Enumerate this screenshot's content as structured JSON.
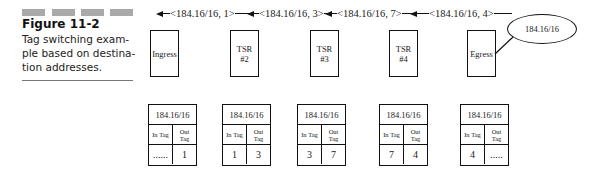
{
  "figure": {
    "number": "Figure 11-2",
    "caption_lines": [
      "Tag switching exam-",
      "ple based on destina-",
      "tion addresses."
    ]
  },
  "advertisements": [
    {
      "label": "<184.16/16, 1>"
    },
    {
      "label": "<184.16/16, 3>"
    },
    {
      "label": "<184.16/16, 7>"
    },
    {
      "label": "<184.16/16, 4>"
    }
  ],
  "nodes": [
    {
      "line1": "Ingress",
      "line2": ""
    },
    {
      "line1": "TSR",
      "line2": "#2"
    },
    {
      "line1": "TSR",
      "line2": "#3"
    },
    {
      "line1": "TSR",
      "line2": "#4"
    },
    {
      "line1": "Egress",
      "line2": ""
    }
  ],
  "destination": {
    "label": "184.16/16"
  },
  "tables": [
    {
      "prefix": "184.16/16",
      "in_header": "In Tag",
      "out_header_1": "Out",
      "out_header_2": "Tag",
      "in_tag": "......",
      "out_tag": "1"
    },
    {
      "prefix": "184.16/16",
      "in_header": "In Tag",
      "out_header_1": "Out",
      "out_header_2": "Tag",
      "in_tag": "1",
      "out_tag": "3"
    },
    {
      "prefix": "184.16/16",
      "in_header": "In Tag",
      "out_header_1": "Out",
      "out_header_2": "Tag",
      "in_tag": "3",
      "out_tag": "7"
    },
    {
      "prefix": "184.16/16",
      "in_header": "In Tag",
      "out_header_1": "Out",
      "out_header_2": "Tag",
      "in_tag": "7",
      "out_tag": "4"
    },
    {
      "prefix": "184.16/16",
      "in_header": "In Tag",
      "out_header_1": "Out",
      "out_header_2": "Tag",
      "in_tag": "4",
      "out_tag": "....."
    }
  ]
}
